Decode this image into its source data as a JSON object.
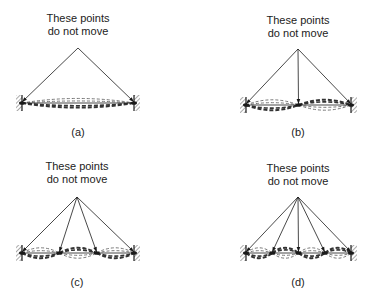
{
  "figure": {
    "panels": [
      {
        "id": "a",
        "label": "(a)",
        "caption_line1": "These points",
        "caption_line2": "do not move",
        "loops": 1,
        "wall_left_x": 22,
        "wall_right_x": 134,
        "string_y": 103,
        "apex": [
          78,
          48
        ],
        "label_pos": [
          78,
          136
        ],
        "caption_pos": [
          78,
          22
        ]
      },
      {
        "id": "b",
        "label": "(b)",
        "caption_line1": "These points",
        "caption_line2": "do not move",
        "loops": 2,
        "wall_left_x": 246,
        "wall_right_x": 351,
        "string_y": 105,
        "apex": [
          298,
          49
        ],
        "label_pos": [
          298,
          136
        ],
        "caption_pos": [
          298,
          24
        ]
      },
      {
        "id": "c",
        "label": "(c)",
        "caption_line1": "These points",
        "caption_line2": "do not move",
        "loops": 3,
        "wall_left_x": 22,
        "wall_right_x": 134,
        "string_y": 253,
        "apex": [
          77,
          197
        ],
        "label_pos": [
          77,
          286
        ],
        "caption_pos": [
          77,
          170
        ]
      },
      {
        "id": "d",
        "label": "(d)",
        "caption_line1": "These points",
        "caption_line2": "do not move",
        "loops": 4,
        "wall_left_x": 246,
        "wall_right_x": 351,
        "string_y": 253,
        "apex": [
          298,
          197
        ],
        "label_pos": [
          298,
          286
        ],
        "caption_pos": [
          298,
          172
        ]
      }
    ],
    "colors": {
      "ink": "#1a1a1a",
      "dash_dark": "#333333",
      "dash_light": "#777777",
      "hatch": "#555555",
      "background": "#ffffff"
    }
  }
}
